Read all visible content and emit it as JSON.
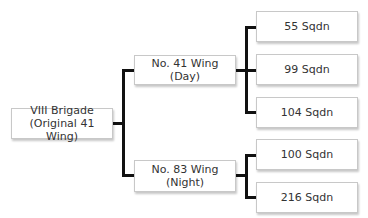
{
  "diagram": {
    "type": "org-chart",
    "root": {
      "label": "VIII Brigade\n(Original 41 Wing)"
    },
    "wings": [
      {
        "label": "No. 41 Wing (Day)",
        "squadrons": [
          "55 Sqdn",
          "99 Sqdn",
          "104 Sqdn"
        ]
      },
      {
        "label": "No. 83 Wing\n(Night)",
        "squadrons": [
          "100 Sqdn",
          "216 Sqdn"
        ]
      }
    ]
  },
  "colors": {
    "box_border": "#c8c8c8",
    "connector": "#111111",
    "text": "#333333"
  }
}
